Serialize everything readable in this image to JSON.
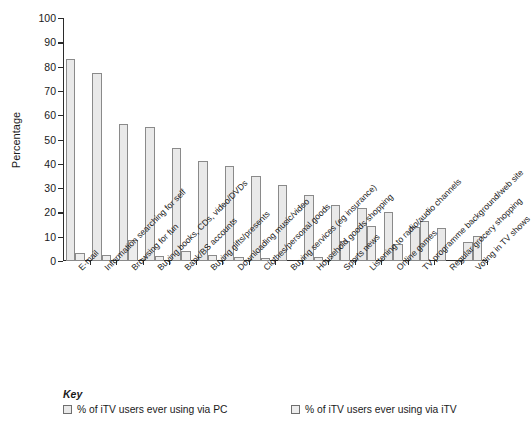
{
  "chart_data": {
    "type": "bar",
    "title": "",
    "xlabel": "",
    "ylabel": "Percentage",
    "ylim": [
      0,
      100
    ],
    "ytick_step": 10,
    "yticks": [
      0,
      10,
      20,
      30,
      40,
      50,
      60,
      70,
      80,
      90,
      100
    ],
    "grid": false,
    "legend_position": "bottom-left",
    "legend_title": "Key",
    "categories": [
      "E-mail",
      "Information searching for self",
      "Browsing for fun",
      "Buying books, CDs, video/DVDs",
      "Bank/BS accounts",
      "Buying gifts/presents",
      "Downloading music/video",
      "Clothes/personal goods",
      "Buying services (eg insurance)",
      "Household goods shopping",
      "Sports news",
      "Listening to radio/audio channels",
      "Online games",
      "TV programme background/web site",
      "Regular grocery shopping",
      "Voting in TV shows"
    ],
    "series": [
      {
        "name": "% of iTV users ever using via PC",
        "color": "#e9e9e9",
        "values": [
          83,
          77.5,
          56.5,
          55,
          46.5,
          41,
          39,
          35,
          31.3,
          27,
          23,
          22,
          20,
          13.8,
          13.7,
          7.8
        ]
      },
      {
        "name": "% of iTV users ever using via iTV",
        "color": "#ededed",
        "values": [
          3.2,
          2.6,
          8.5,
          2,
          4,
          2.3,
          1.5,
          1.4,
          0,
          1.7,
          8.3,
          14.3,
          7,
          16.5,
          0,
          10.3
        ]
      }
    ]
  },
  "colors": {
    "axis": "#2b2b2b",
    "bar_fill": "#e9e9e9",
    "bar_border": "#8a8a8a",
    "text": "#1a1a1a",
    "background": "#ffffff"
  }
}
